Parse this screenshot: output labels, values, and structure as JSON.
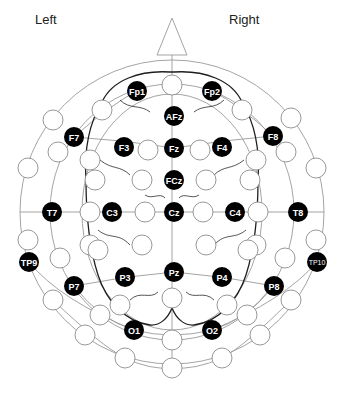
{
  "labels": {
    "left": "Left",
    "right": "Right"
  },
  "colors": {
    "electrode_fill": "#000000",
    "electrode_text": "#ffffff",
    "grid": "#9a9a9a",
    "brain_outline": "#1e1e1e",
    "background": "#ffffff"
  },
  "head": {
    "center": [
      172,
      212
    ],
    "radius": 152,
    "nose_apex": [
      172,
      18
    ]
  },
  "electrodes": [
    {
      "name": "Fp1",
      "x": 137,
      "y": 91
    },
    {
      "name": "Fp2",
      "x": 212,
      "y": 91
    },
    {
      "name": "AFz",
      "x": 174,
      "y": 116
    },
    {
      "name": "F7",
      "x": 74,
      "y": 137
    },
    {
      "name": "F3",
      "x": 124,
      "y": 147
    },
    {
      "name": "Fz",
      "x": 174,
      "y": 148
    },
    {
      "name": "F4",
      "x": 222,
      "y": 147
    },
    {
      "name": "F8",
      "x": 273,
      "y": 136
    },
    {
      "name": "FCz",
      "x": 174,
      "y": 180
    },
    {
      "name": "T7",
      "x": 52,
      "y": 212
    },
    {
      "name": "C3",
      "x": 112,
      "y": 212
    },
    {
      "name": "Cz",
      "x": 174,
      "y": 212
    },
    {
      "name": "C4",
      "x": 235,
      "y": 212
    },
    {
      "name": "T8",
      "x": 298,
      "y": 212
    },
    {
      "name": "TP9",
      "x": 29,
      "y": 262
    },
    {
      "name": "P7",
      "x": 74,
      "y": 286
    },
    {
      "name": "P3",
      "x": 125,
      "y": 277
    },
    {
      "name": "Pz",
      "x": 174,
      "y": 272
    },
    {
      "name": "P4",
      "x": 222,
      "y": 277
    },
    {
      "name": "P8",
      "x": 274,
      "y": 286
    },
    {
      "name": "TP10",
      "x": 317,
      "y": 262
    },
    {
      "name": "O1",
      "x": 134,
      "y": 330
    },
    {
      "name": "O2",
      "x": 212,
      "y": 330
    }
  ],
  "open_sites": [
    [
      172,
      85
    ],
    [
      102,
      110
    ],
    [
      242,
      110
    ],
    [
      53,
      120
    ],
    [
      291,
      118
    ],
    [
      28,
      168
    ],
    [
      316,
      168
    ],
    [
      58,
      152
    ],
    [
      286,
      152
    ],
    [
      148,
      150
    ],
    [
      200,
      150
    ],
    [
      90,
      160
    ],
    [
      256,
      160
    ],
    [
      95,
      180
    ],
    [
      250,
      180
    ],
    [
      142,
      180
    ],
    [
      206,
      180
    ],
    [
      90,
      212
    ],
    [
      258,
      212
    ],
    [
      145,
      212
    ],
    [
      203,
      212
    ],
    [
      60,
      258
    ],
    [
      285,
      258
    ],
    [
      90,
      245
    ],
    [
      256,
      245
    ],
    [
      142,
      245
    ],
    [
      206,
      245
    ],
    [
      120,
      305
    ],
    [
      227,
      305
    ],
    [
      100,
      315
    ],
    [
      247,
      315
    ],
    [
      172,
      298
    ],
    [
      172,
      340
    ],
    [
      53,
      300
    ],
    [
      291,
      300
    ],
    [
      85,
      335
    ],
    [
      260,
      335
    ],
    [
      125,
      358
    ],
    [
      222,
      358
    ],
    [
      172,
      368
    ],
    [
      98,
      250
    ],
    [
      248,
      250
    ],
    [
      28,
      240
    ],
    [
      316,
      240
    ]
  ]
}
